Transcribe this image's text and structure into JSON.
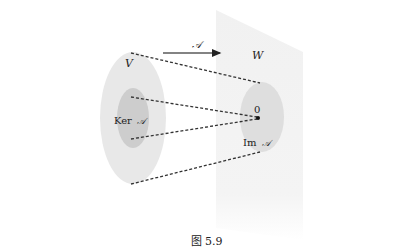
{
  "figure": {
    "caption": "图 5.9",
    "mapping_label": "𝒜",
    "domain_space": {
      "label": "V",
      "subspace_label_prefix": "Ker",
      "subspace_label_map": "𝒜"
    },
    "codomain_space": {
      "label": "W",
      "zero_label": "0",
      "image_label_prefix": "Im",
      "image_label_map": "𝒜"
    },
    "colors": {
      "plane_fill": "#f3f3f3",
      "outer_ellipse_fill": "#e6e6e6",
      "ker_fill": "#cfcfcf",
      "im_fill": "#e0e0e0",
      "dash_stroke": "#333333",
      "arrow_stroke": "#555555",
      "text": "#222222"
    }
  }
}
